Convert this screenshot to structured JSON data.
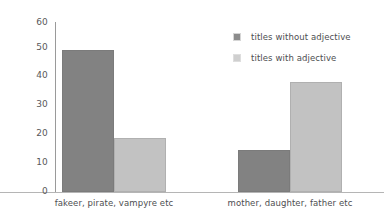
{
  "chart_data": {
    "type": "bar",
    "title": "",
    "xlabel": "",
    "ylabel": "",
    "ylim": [
      0,
      60
    ],
    "yticks": [
      "0",
      "10",
      "20",
      "30",
      "40",
      "50",
      "60"
    ],
    "grid": false,
    "legend_position": "top-right",
    "categories": [
      "fakeer, pirate, vampyre etc",
      "mother, daughter, father etc"
    ],
    "series": [
      {
        "name": "titles without adjective",
        "color": "#828282",
        "values": [
          50,
          15
        ]
      },
      {
        "name": "titles with adjective",
        "color": "#c2c2c2",
        "values": [
          19,
          39
        ]
      }
    ]
  },
  "axis": {
    "y_ticks": [
      {
        "label": "60",
        "value": 60
      },
      {
        "label": "50",
        "value": 50
      },
      {
        "label": "40",
        "value": 40
      },
      {
        "label": "30",
        "value": 30
      },
      {
        "label": "20",
        "value": 20
      },
      {
        "label": "10",
        "value": 10
      },
      {
        "label": "0",
        "value": 0
      }
    ]
  },
  "legend": {
    "items": [
      {
        "label": "titles without adjective",
        "swatch": "dark"
      },
      {
        "label": "titles with adjective",
        "swatch": "light"
      }
    ]
  }
}
